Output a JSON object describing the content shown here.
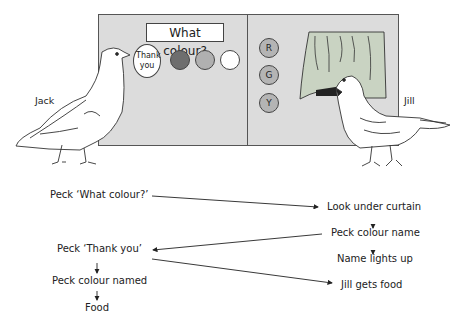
{
  "apparatus": {
    "left_panel": {
      "title_key": "What colour?",
      "thank_you_key": "Thank you",
      "colour_keys": [
        {
          "name": "dark",
          "color": "#6e6e6e"
        },
        {
          "name": "medium",
          "color": "#b0b0b0"
        },
        {
          "name": "white",
          "color": "#ffffff"
        }
      ]
    },
    "right_panel": {
      "name_keys": [
        "R",
        "G",
        "Y"
      ],
      "curtain_color": "#c9d3c2"
    },
    "panel_color": "#dcdcdc"
  },
  "birds": {
    "left": "Jack",
    "right": "Jill"
  },
  "flow": {
    "jack_steps": [
      "Peck ‘What colour?’",
      "Peck ‘Thank you’",
      "Peck colour named",
      "Food"
    ],
    "jill_steps": [
      "Look under curtain",
      "Peck colour name",
      "Name lights up",
      "Jill gets food"
    ]
  }
}
